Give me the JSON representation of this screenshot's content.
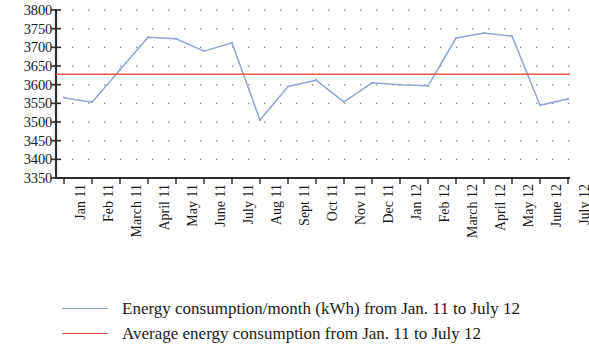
{
  "chart_data": {
    "type": "line",
    "title": "",
    "xlabel": "",
    "ylabel": "",
    "ylim": [
      3350,
      3800
    ],
    "ytick_step": 50,
    "grid": "dotted",
    "legend_position": "bottom-left",
    "categories": [
      "Jan 11",
      "Feb 11",
      "March 11",
      "April 11",
      "May 11",
      "June 11",
      "July 11",
      "Aug 11",
      "Sept 11",
      "Oct 11",
      "Nov 11",
      "Dec 11",
      "Jan 12",
      "Feb 12",
      "March 12",
      "April 12",
      "May 12",
      "June 12",
      "July 12"
    ],
    "yticks": [
      "3350",
      "3400",
      "3450",
      "3500",
      "3550",
      "3600",
      "3650",
      "3700",
      "3750",
      "3800"
    ],
    "series": [
      {
        "name": "Energy consumption/month (kWh) from Jan. 11 to July 12",
        "type": "line",
        "color": "#8fa6d4",
        "values": [
          3565,
          3553,
          3640,
          3727,
          3723,
          3690,
          3712,
          3505,
          3595,
          3612,
          3554,
          3605,
          3600,
          3597,
          3725,
          3738,
          3730,
          3545,
          3562
        ]
      },
      {
        "name": "Average energy consumption from Jan. 11 to July 12",
        "type": "hline",
        "color": "#e05a46",
        "value": 3628
      }
    ]
  },
  "legend": {
    "items": [
      {
        "label": "Energy consumption/month (kWh) from Jan. 11 to July 12",
        "color": "#8fa6d4",
        "swatch": "line-swatch-series"
      },
      {
        "label": "Average energy consumption from Jan. 11 to July 12",
        "color": "#e05a46",
        "swatch": "line-swatch-average"
      }
    ]
  },
  "axes": {
    "y_axis_color": "#2b2b2b",
    "x_axis_color": "#2b2b2b",
    "grid_dot_color": "#7a7aa8"
  }
}
